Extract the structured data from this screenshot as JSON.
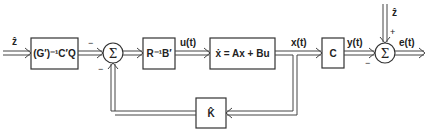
{
  "diagram": {
    "title": "",
    "input_label": "ẑ",
    "blocks": {
      "gain_in": "(G′)⁻¹C′Q",
      "controller": "R⁻¹B′",
      "plant": "ẋ = Ax + Bu",
      "output_map": "C",
      "estimator_gain": "K̂"
    },
    "signals": {
      "u": "u(t)",
      "x": "x(t)",
      "y": "y(t)",
      "e": "e(t)",
      "z_hat_top": "ẑ"
    },
    "summing_junctions": {
      "sum1": {
        "symbol": "Σ",
        "sign_in": "−",
        "sign_feedback": "−"
      },
      "sum2": {
        "symbol": "Σ",
        "sign_y": "−",
        "sign_z": "+"
      }
    }
  }
}
